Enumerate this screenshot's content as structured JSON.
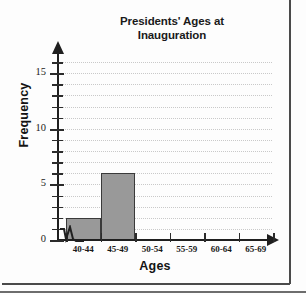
{
  "chart_data": {
    "type": "bar",
    "title": "Presidents' Ages at Inauguration",
    "title_line1": "Presidents' Ages at",
    "title_line2": "Inauguration",
    "xlabel": "Ages",
    "ylabel": "Frequency",
    "categories": [
      "40-44",
      "45-49",
      "50-54",
      "55-59",
      "60-64",
      "65-69"
    ],
    "values": [
      2,
      6,
      0,
      0,
      0,
      0
    ],
    "ylim": [
      0,
      16
    ],
    "ytick_labels": [
      "0",
      "5",
      "10",
      "15"
    ],
    "ytick_values": [
      0,
      5,
      10,
      15
    ],
    "ytick_step_minor": 1,
    "grid": true,
    "grid_style": "dotted",
    "legend": null,
    "axis_break": true,
    "bar_color": "#999999",
    "bar_border_color": "#3a3a3a",
    "grid_color": "#c9c9c9",
    "axis_color": "#1f1f1f"
  }
}
